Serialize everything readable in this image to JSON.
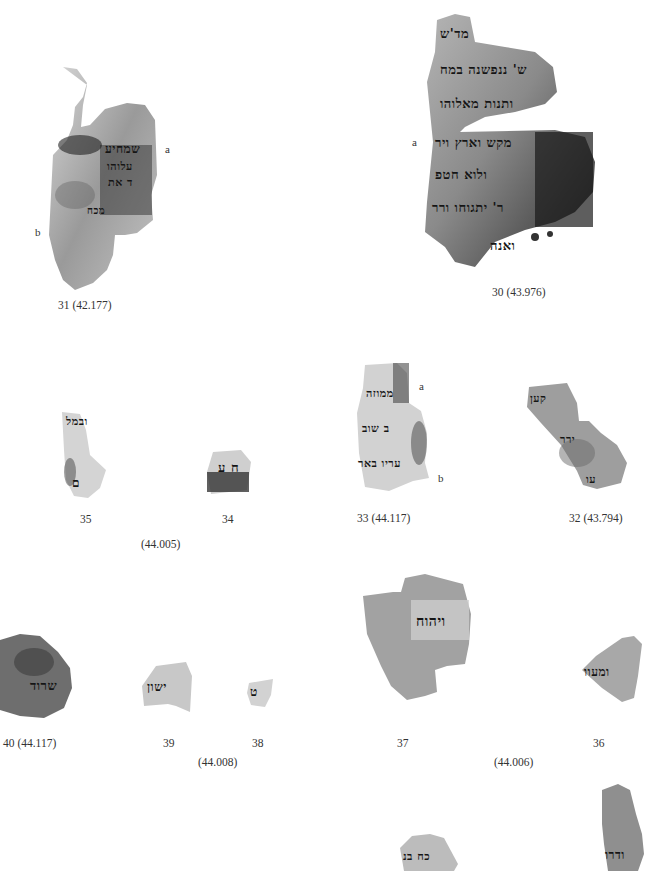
{
  "plate": {
    "colors": {
      "background": "#ffffff",
      "ink": "#151515",
      "caption": "#333333"
    },
    "fragments": [
      {
        "id": "31",
        "caption": "31 (42.177)",
        "marks": [
          "a",
          "b"
        ],
        "text_lines": [
          "עשו",
          "שמחיע",
          "עלוהו",
          "ד את",
          "מכח",
          "ע"
        ]
      },
      {
        "id": "30",
        "caption": "30 (43.976)",
        "marks": [
          "a"
        ],
        "text_lines": [
          "מד'ש",
          "ש' ננפשנה במח",
          "ותנות מאלוהו",
          "מקש וארץ ויר",
          "ולוא חטפ",
          "ר' יתגוחו ורר",
          "ואנה"
        ]
      },
      {
        "id": "35",
        "caption": "35",
        "text_lines": [
          "ובמל",
          "ם"
        ]
      },
      {
        "id": "34",
        "caption": "34",
        "text_lines": [
          "ח ע"
        ]
      },
      {
        "id": "33",
        "caption": "33 (44.117)",
        "marks": [
          "a",
          "b"
        ],
        "text_lines": [
          "ממוזה",
          "ב שוב",
          "עריו באר"
        ]
      },
      {
        "id": "32",
        "caption": "32 (43.794)",
        "text_lines": [
          "קען",
          "ירר",
          "עו"
        ]
      },
      {
        "id": "40",
        "caption": "40 (44.117)",
        "text_lines": [
          "שרוד"
        ]
      },
      {
        "id": "39",
        "caption": "39",
        "text_lines": [
          "ישון"
        ]
      },
      {
        "id": "38",
        "caption": "38",
        "text_lines": [
          "ט"
        ]
      },
      {
        "id": "37",
        "caption": "37",
        "text_lines": [
          "ויהוח"
        ]
      },
      {
        "id": "36",
        "caption": "36",
        "text_lines": [
          "ומעוו"
        ]
      },
      {
        "id": "41",
        "caption": "",
        "text_lines": [
          "כח בנ"
        ]
      },
      {
        "id": "42",
        "caption": "",
        "text_lines": [
          "ודרו"
        ]
      }
    ],
    "group_captions": {
      "g_35_34": "(44.005)",
      "g_39_38": "(44.008)",
      "g_37_36": "(44.006)"
    }
  }
}
